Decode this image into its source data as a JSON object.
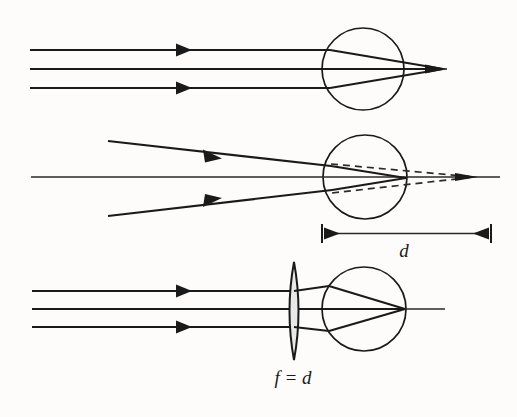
{
  "figure": {
    "background_color": "#fdfcfb",
    "ink_color": "#1a1a1a",
    "lens_fill_color": "#e9e9e9",
    "width": 517,
    "height": 417
  },
  "labels": {
    "distance_d": "d",
    "focal_length": "f = d"
  },
  "panels": [
    {
      "id": "panel-parallel-rays",
      "name": "Parallel rays focused by sphere",
      "sphere": {
        "cx": 363,
        "cy": 69,
        "r": 41
      },
      "axis": {
        "x1": 31,
        "y1": 69,
        "x2": 447,
        "y2": 69
      },
      "rays": [
        {
          "name": "upper-ray",
          "start_x": 30,
          "start_y": 50,
          "hit_x": 330,
          "hit_y": 50,
          "focus_x": 443,
          "focus_y": 69,
          "arrow_x": 190,
          "arrowhead": true
        },
        {
          "name": "axis-ray",
          "start_x": 30,
          "start_y": 69,
          "hit_x": 322,
          "hit_y": 69,
          "focus_x": 443,
          "focus_y": 69,
          "arrow_x": 190,
          "arrowhead": false
        },
        {
          "name": "lower-ray",
          "start_x": 30,
          "start_y": 88,
          "hit_x": 330,
          "hit_y": 88,
          "focus_x": 443,
          "focus_y": 69,
          "arrow_x": 190,
          "arrowhead": true
        }
      ]
    },
    {
      "id": "panel-converging-rays",
      "name": "Converging rays, virtual focus at distance d",
      "sphere": {
        "cx": 365,
        "cy": 177,
        "r": 42
      },
      "axis": {
        "x1": 31,
        "y1": 177,
        "x2": 500,
        "y2": 177
      },
      "real_focus": {
        "x": 405,
        "y": 178
      },
      "virtual_focus": {
        "x": 474,
        "y": 177
      },
      "rays": [
        {
          "name": "upper-ray",
          "start_x": 108,
          "start_y": 141,
          "hit_x": 331,
          "hit_y": 166,
          "arrow_x": 215,
          "arrowhead": true
        },
        {
          "name": "axis-ray",
          "start_x": 31,
          "start_y": 177,
          "hit_x": 323,
          "hit_y": 177,
          "arrow_x": 0,
          "arrowhead": false
        },
        {
          "name": "lower-ray",
          "start_x": 108,
          "start_y": 216,
          "hit_x": 332,
          "hit_y": 190,
          "arrow_x": 215,
          "arrowhead": true
        }
      ],
      "dimension": {
        "x_left": 322,
        "x_right": 491,
        "y": 233,
        "label_x": 404,
        "label_y": 256
      }
    },
    {
      "id": "panel-lens-plus-sphere",
      "name": "Collimating lens of focal length f = d in front of sphere",
      "sphere": {
        "cx": 364,
        "cy": 309,
        "r": 42
      },
      "axis": {
        "x1": 32,
        "y1": 309,
        "x2": 445,
        "y2": 309
      },
      "focus": {
        "x": 404,
        "y": 309
      },
      "lens": {
        "cx": 294,
        "cy": 311,
        "half_width": 9,
        "half_height": 49
      },
      "rays": [
        {
          "name": "upper-ray",
          "start_x": 32,
          "start_y": 291,
          "lens_x": 294,
          "hit_x": 329,
          "hit_y": 286,
          "arrow_x": 190,
          "arrowhead": true
        },
        {
          "name": "axis-ray",
          "start_x": 32,
          "start_y": 309,
          "lens_x": 294,
          "hit_x": 322,
          "hit_y": 309,
          "arrow_x": 190,
          "arrowhead": false
        },
        {
          "name": "lower-ray",
          "start_x": 32,
          "start_y": 327,
          "lens_x": 294,
          "hit_x": 329,
          "hit_y": 331,
          "arrow_x": 190,
          "arrowhead": true
        }
      ],
      "label": {
        "x": 293,
        "y": 383
      }
    }
  ]
}
